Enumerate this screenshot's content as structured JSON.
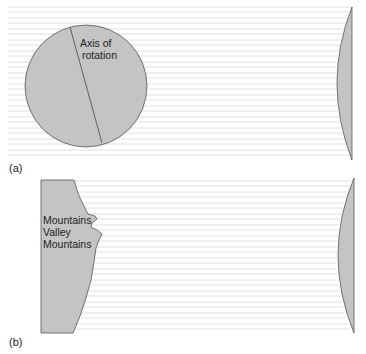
{
  "panel_a": {
    "label": "(a)",
    "circle_label_line1": "Axis of",
    "circle_label_line2": "rotation"
  },
  "panel_b": {
    "label": "(b)",
    "land_label_line1": "Mountains",
    "land_label_line2": "Valley",
    "land_label_line3": "Mountains"
  },
  "colors": {
    "land_fill": "#c4c4c4",
    "outline": "#555555",
    "wave_lines": "#d8d8d8",
    "background": "#ffffff"
  }
}
